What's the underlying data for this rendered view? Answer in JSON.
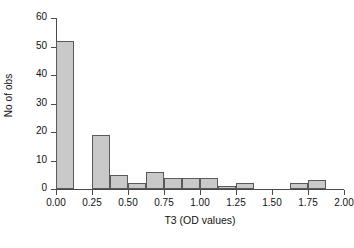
{
  "chart_data": {
    "type": "bar",
    "title": "",
    "subtitle": "",
    "xlabel": "T3 (OD values)",
    "ylabel": "No of obs",
    "xlim": [
      0.0,
      2.0
    ],
    "ylim": [
      0,
      60
    ],
    "bin_width": 0.125,
    "grid": false,
    "legend": false,
    "bar_fill_color": "#c9c9c9",
    "bar_edge_color": "#5a5a5a",
    "axis_color": "#4a4a4a",
    "x_ticks": [
      {
        "value": 0.0,
        "label": "0.00"
      },
      {
        "value": 0.25,
        "label": "0.25"
      },
      {
        "value": 0.5,
        "label": "0.50"
      },
      {
        "value": 0.75,
        "label": "0.75"
      },
      {
        "value": 1.0,
        "label": "1.00"
      },
      {
        "value": 1.25,
        "label": "1.25"
      },
      {
        "value": 1.5,
        "label": "1.50"
      },
      {
        "value": 1.75,
        "label": "1.75"
      },
      {
        "value": 2.0,
        "label": "2.00"
      }
    ],
    "y_ticks": [
      {
        "value": 0,
        "label": "0"
      },
      {
        "value": 10,
        "label": "10"
      },
      {
        "value": 20,
        "label": "20"
      },
      {
        "value": 30,
        "label": "30"
      },
      {
        "value": 40,
        "label": "40"
      },
      {
        "value": 50,
        "label": "50"
      },
      {
        "value": 60,
        "label": "60"
      }
    ],
    "bins": [
      {
        "x0": 0.0,
        "x1": 0.125,
        "label": "0.000-0.125",
        "value": 52
      },
      {
        "x0": 0.125,
        "x1": 0.25,
        "label": "0.125-0.250",
        "value": 0
      },
      {
        "x0": 0.25,
        "x1": 0.375,
        "label": "0.250-0.375",
        "value": 19
      },
      {
        "x0": 0.375,
        "x1": 0.5,
        "label": "0.375-0.500",
        "value": 5
      },
      {
        "x0": 0.5,
        "x1": 0.625,
        "label": "0.500-0.625",
        "value": 2
      },
      {
        "x0": 0.625,
        "x1": 0.75,
        "label": "0.625-0.750",
        "value": 6
      },
      {
        "x0": 0.75,
        "x1": 0.875,
        "label": "0.750-0.875",
        "value": 4
      },
      {
        "x0": 0.875,
        "x1": 1.0,
        "label": "0.875-1.000",
        "value": 4
      },
      {
        "x0": 1.0,
        "x1": 1.125,
        "label": "1.000-1.125",
        "value": 4
      },
      {
        "x0": 1.125,
        "x1": 1.25,
        "label": "1.125-1.250",
        "value": 1
      },
      {
        "x0": 1.25,
        "x1": 1.375,
        "label": "1.250-1.375",
        "value": 2
      },
      {
        "x0": 1.375,
        "x1": 1.5,
        "label": "1.375-1.500",
        "value": 0
      },
      {
        "x0": 1.5,
        "x1": 1.625,
        "label": "1.500-1.625",
        "value": 0
      },
      {
        "x0": 1.625,
        "x1": 1.75,
        "label": "1.625-1.750",
        "value": 2
      },
      {
        "x0": 1.75,
        "x1": 1.875,
        "label": "1.750-1.875",
        "value": 3
      },
      {
        "x0": 1.875,
        "x1": 2.0,
        "label": "1.875-2.000",
        "value": 0
      }
    ],
    "categories": [
      "0.000-0.125",
      "0.125-0.250",
      "0.250-0.375",
      "0.375-0.500",
      "0.500-0.625",
      "0.625-0.750",
      "0.750-0.875",
      "0.875-1.000",
      "1.000-1.125",
      "1.125-1.250",
      "1.250-1.375",
      "1.375-1.500",
      "1.500-1.625",
      "1.625-1.750",
      "1.750-1.875",
      "1.875-2.000"
    ],
    "values": [
      52,
      0,
      19,
      5,
      2,
      6,
      4,
      4,
      4,
      1,
      2,
      0,
      0,
      2,
      3,
      0
    ]
  }
}
